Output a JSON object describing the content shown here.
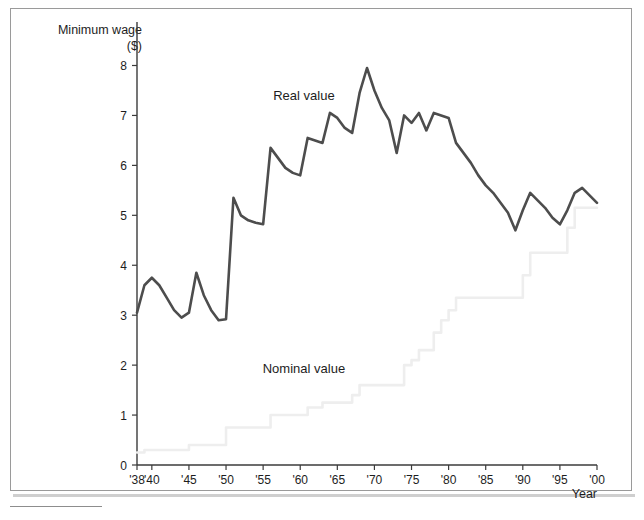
{
  "chart_data": {
    "type": "line",
    "title": "",
    "ylabel_line1": "Minimum wage",
    "ylabel_line2": "($)",
    "xlabel": "Year",
    "xlim": [
      1938,
      2000
    ],
    "ylim": [
      0,
      8
    ],
    "yticks": [
      0,
      1,
      2,
      3,
      4,
      5,
      6,
      7,
      8
    ],
    "ytick_labels": [
      "0",
      "1",
      "2",
      "3",
      "4",
      "5",
      "6",
      "7",
      "8"
    ],
    "xticks": [
      1938,
      1940,
      1945,
      1950,
      1955,
      1960,
      1965,
      1970,
      1975,
      1980,
      1985,
      1990,
      1995,
      2000
    ],
    "xtick_labels": [
      "'38",
      "'40",
      "'45",
      "'50",
      "'55",
      "'60",
      "'65",
      "'70",
      "'75",
      "'80",
      "'85",
      "'90",
      "'95",
      "'00"
    ],
    "grid": false,
    "legend_position": "inline-annotations",
    "colors": {
      "real": "#4d4d4d",
      "nominal": "#eeeeee",
      "axis": "#3b3b3b",
      "frame": "#9a9a9a",
      "text": "#1d1d1d"
    },
    "annotations": [
      {
        "name": "real-value-label",
        "text": "Real value",
        "x": 1960.5,
        "y": 7.3
      },
      {
        "name": "nominal-value-label",
        "text": "Nominal value",
        "x": 1960.5,
        "y": 1.85
      }
    ],
    "x": [
      1938,
      1939,
      1940,
      1941,
      1942,
      1943,
      1944,
      1945,
      1946,
      1947,
      1948,
      1949,
      1950,
      1951,
      1952,
      1953,
      1954,
      1955,
      1956,
      1957,
      1958,
      1959,
      1960,
      1961,
      1962,
      1963,
      1964,
      1965,
      1966,
      1967,
      1968,
      1969,
      1970,
      1971,
      1972,
      1973,
      1974,
      1975,
      1976,
      1977,
      1978,
      1979,
      1980,
      1981,
      1982,
      1983,
      1984,
      1985,
      1986,
      1987,
      1988,
      1989,
      1990,
      1991,
      1992,
      1993,
      1994,
      1995,
      1996,
      1997,
      1998,
      1999,
      2000
    ],
    "series": [
      {
        "name": "Real value",
        "color": "#4d4d4d",
        "values": [
          3.05,
          3.6,
          3.75,
          3.6,
          3.35,
          3.1,
          2.95,
          3.05,
          3.85,
          3.4,
          3.1,
          2.9,
          2.92,
          5.35,
          5.0,
          4.9,
          4.85,
          4.82,
          6.35,
          6.15,
          5.95,
          5.85,
          5.8,
          6.55,
          6.5,
          6.45,
          7.05,
          6.95,
          6.75,
          6.65,
          7.45,
          7.95,
          7.5,
          7.15,
          6.9,
          6.25,
          7.0,
          6.85,
          7.05,
          6.7,
          7.05,
          7.0,
          6.95,
          6.45,
          6.25,
          6.05,
          5.8,
          5.6,
          5.45,
          5.25,
          5.05,
          4.7,
          5.1,
          5.45,
          5.3,
          5.15,
          4.95,
          4.82,
          5.1,
          5.45,
          5.55,
          5.4,
          5.25
        ]
      },
      {
        "name": "Nominal value",
        "color": "#eeeeee",
        "values": [
          0.25,
          0.3,
          0.3,
          0.3,
          0.3,
          0.3,
          0.3,
          0.4,
          0.4,
          0.4,
          0.4,
          0.4,
          0.75,
          0.75,
          0.75,
          0.75,
          0.75,
          0.75,
          1.0,
          1.0,
          1.0,
          1.0,
          1.0,
          1.15,
          1.15,
          1.25,
          1.25,
          1.25,
          1.25,
          1.4,
          1.6,
          1.6,
          1.6,
          1.6,
          1.6,
          1.6,
          2.0,
          2.1,
          2.3,
          2.3,
          2.65,
          2.9,
          3.1,
          3.35,
          3.35,
          3.35,
          3.35,
          3.35,
          3.35,
          3.35,
          3.35,
          3.35,
          3.8,
          4.25,
          4.25,
          4.25,
          4.25,
          4.25,
          4.75,
          5.15,
          5.15,
          5.15,
          5.15
        ]
      }
    ]
  }
}
